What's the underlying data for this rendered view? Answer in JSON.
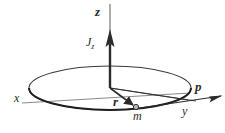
{
  "figure": {
    "kind": "physics-vector-diagram",
    "background_color": "#ffffff",
    "stroke_color": "#2b2b2b",
    "labels": {
      "z_axis": "z",
      "angular_momentum": "J",
      "angular_momentum_subscript": "z",
      "x_axis": "x",
      "y_axis": "y",
      "radius_vector": "r",
      "mass_point": "m",
      "momentum_vector": "p"
    },
    "geometry": {
      "origin_x": 110,
      "origin_y": 88,
      "orbit_radius_x": 81,
      "orbit_radius_y": 22,
      "z_axis_top_y": 4,
      "z_arrow_tip_y": 30,
      "mass_point_x": 136,
      "mass_point_y": 107,
      "momentum_arrow_tip_x": 222,
      "momentum_arrow_tip_y": 97
    }
  }
}
